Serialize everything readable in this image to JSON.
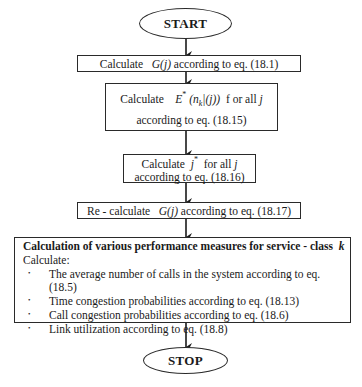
{
  "flowchart": {
    "start_label": "START",
    "stop_label": "STOP",
    "steps": [
      {
        "id": "step1",
        "prefix": "Calculate",
        "math": "G(j)",
        "suffix": "according to  eq. (18.1)"
      },
      {
        "id": "step2",
        "line1_prefix": "Calculate",
        "math_E": "E",
        "math_star": "*",
        "math_n": "(n",
        "math_k": "k",
        "math_rest": "|(j))",
        "line1_suffix": "f or all",
        "math_j": "j",
        "line2": "according to  eq. (18.15)"
      },
      {
        "id": "step3",
        "line1_prefix": "Calculate",
        "math_j": "j",
        "math_star": "*",
        "line1_suffix": "for all",
        "math_j2": "j",
        "line2": "according to  eq.  (18.16)"
      },
      {
        "id": "step4",
        "prefix": "Re -  calculate",
        "math": "G(j)",
        "suffix": "according to  eq. (18.17)"
      },
      {
        "id": "step5",
        "title_prefix": "Calculation  of various performance measures for service  -  class",
        "title_math": "k",
        "subtitle": "Calculate:",
        "items": [
          "The average number of calls in the system according to eq. (18.5)",
          "Time congestion probabilities  according to  eq. (18.13)",
          "Call congestion probabilities according to eq. (18.6)",
          "Link utilization according to eq. (18.8)"
        ]
      }
    ]
  }
}
